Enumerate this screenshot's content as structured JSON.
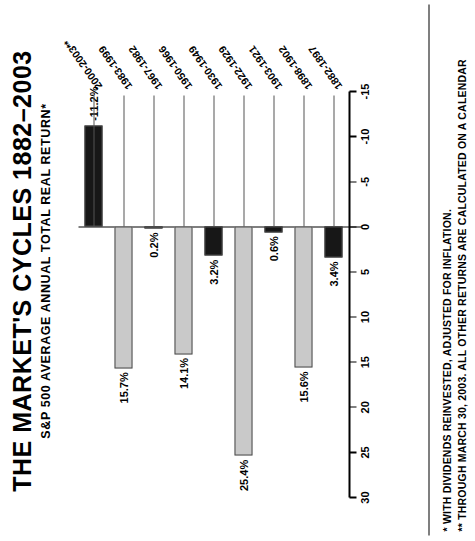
{
  "title": {
    "main": "THE MARKET'S CYCLES 1882–2003",
    "sub": "S&P 500 AVERAGE ANNUAL TOTAL REAL RETURN*"
  },
  "footnotes": {
    "line1": "* WITH DIVIDENDS REINVESTED, ADJUSTED FOR INFLATION.",
    "line2": "** THROUGH MARCH 30, 2003. ALL OTHER RETURNS ARE CALCULATED ON A CALENDAR"
  },
  "colors": {
    "bull_bar": "#c9c9c9",
    "bear_bar": "#171717",
    "bar_outline": "#4a4a4a",
    "axis": "#000000",
    "background": "#ffffff"
  },
  "chart_data": {
    "type": "bar",
    "orientation": "horizontal",
    "title": "THE MARKET'S CYCLES 1882–2003",
    "subtitle": "S&P 500 AVERAGE ANNUAL TOTAL REAL RETURN*",
    "xlabel": "",
    "ylabel": "",
    "xlim": [
      -15,
      30
    ],
    "ticks": [
      30,
      25,
      20,
      15,
      10,
      5,
      0,
      -5,
      -10,
      -15
    ],
    "tick_labels": [
      "30",
      "25",
      "20",
      "15",
      "10",
      "5",
      "0",
      "-5",
      "-10",
      "-15"
    ],
    "grid": false,
    "legend": "none",
    "categories": [
      "1882-1897",
      "1898-1902",
      "1903-1921",
      "1922-1929",
      "1930-1949",
      "1950-1966",
      "1967-1982",
      "1983-1999",
      "2000-2003**"
    ],
    "values": [
      3.4,
      15.6,
      0.6,
      25.4,
      3.2,
      14.1,
      0.2,
      15.7,
      -11.2
    ],
    "value_labels": [
      "3.4%",
      "15.6%",
      "0.6%",
      "25.4%",
      "3.2%",
      "14.1%",
      "0.2%",
      "15.7%",
      "-11.2%"
    ],
    "bar_styles": [
      "bear",
      "bull",
      "bear",
      "bull",
      "bear",
      "bull",
      "bear",
      "bull",
      "bear"
    ]
  }
}
